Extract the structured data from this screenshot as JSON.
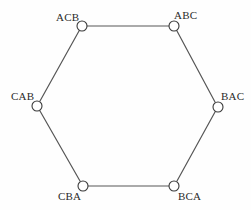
{
  "diagram": {
    "type": "graph",
    "title": "",
    "shape": "hexagon",
    "background_color": "#fefefe",
    "edge_color": "#565656",
    "node_stroke_color": "#3a3a3a",
    "node_fill_color": "#ffffff",
    "label_color": "#2b2b2b",
    "nodes": [
      {
        "id": "ACB",
        "label": "ACB",
        "cx": 82,
        "cy": 26,
        "r": 5,
        "label_x": 56,
        "label_y": 11
      },
      {
        "id": "ABC",
        "label": "ABC",
        "cx": 174,
        "cy": 26,
        "r": 5,
        "label_x": 174,
        "label_y": 9
      },
      {
        "id": "BAC",
        "label": "BAC",
        "cx": 218,
        "cy": 107,
        "r": 5,
        "label_x": 221,
        "label_y": 90
      },
      {
        "id": "BCA",
        "label": "BCA",
        "cx": 174,
        "cy": 186,
        "r": 5,
        "label_x": 178,
        "label_y": 190
      },
      {
        "id": "CBA",
        "label": "CBA",
        "cx": 83,
        "cy": 186,
        "r": 5,
        "label_x": 58,
        "label_y": 190
      },
      {
        "id": "CAB",
        "label": "CAB",
        "cx": 37,
        "cy": 106,
        "r": 5,
        "label_x": 11,
        "label_y": 90
      }
    ],
    "edges": [
      {
        "id": "edge-acb-abc",
        "from": "ACB",
        "to": "ABC",
        "x1": 87,
        "y1": 26,
        "x2": 169,
        "y2": 26
      },
      {
        "id": "edge-abc-bac",
        "from": "ABC",
        "to": "BAC",
        "x1": 177,
        "y1": 31,
        "x2": 215,
        "y2": 102
      },
      {
        "id": "edge-bac-bca",
        "from": "BAC",
        "to": "BCA",
        "x1": 215,
        "y1": 112,
        "x2": 177,
        "y2": 181
      },
      {
        "id": "edge-bca-cba",
        "from": "BCA",
        "to": "CBA",
        "x1": 169,
        "y1": 186,
        "x2": 88,
        "y2": 186
      },
      {
        "id": "edge-cba-cab",
        "from": "CBA",
        "to": "CAB",
        "x1": 80,
        "y1": 181,
        "x2": 40,
        "y2": 111
      },
      {
        "id": "edge-cab-acb",
        "from": "CAB",
        "to": "ACB",
        "x1": 40,
        "y1": 101,
        "x2": 79,
        "y2": 31
      }
    ]
  }
}
